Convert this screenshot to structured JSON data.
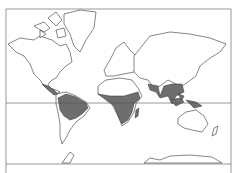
{
  "map": {
    "type": "world-mercator-outline",
    "colors": {
      "background": "#ffffff",
      "land": "#ffffff",
      "outline": "#333333",
      "shaded_region": "#6e6e6e"
    },
    "shaded_regions": [
      "Central America and northern South America",
      "Central Africa",
      "Madagascar (east coast)",
      "India and Southeast Asia",
      "Indonesia / New Guinea"
    ],
    "reference_lines": [
      "equator",
      "bottom-frame"
    ]
  }
}
